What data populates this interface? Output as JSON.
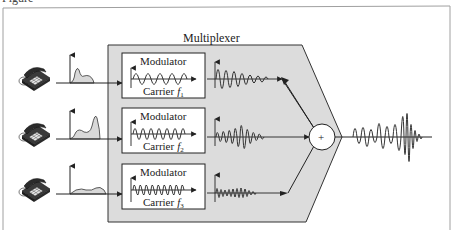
{
  "figure": {
    "caption_partial": "Figure",
    "multiplexer_label": "Multiplexer",
    "sum_symbol": "+",
    "colors": {
      "frame": "#9a9a9a",
      "mux_fill": "#dcdcdc",
      "mux_stroke": "#333333",
      "box_fill": "#ffffff",
      "line": "#222222",
      "spectrum_fill": "#d8d8d8"
    },
    "channels": [
      {
        "name": "channel-1",
        "modulator_label": "Modulator",
        "carrier_label": "Carrier",
        "carrier_sub": "1",
        "carrier_var": "f"
      },
      {
        "name": "channel-2",
        "modulator_label": "Modulator",
        "carrier_label": "Carrier",
        "carrier_sub": "2",
        "carrier_var": "f"
      },
      {
        "name": "channel-3",
        "modulator_label": "Modulator",
        "carrier_label": "Carrier",
        "carrier_sub": "3",
        "carrier_var": "f"
      }
    ]
  }
}
